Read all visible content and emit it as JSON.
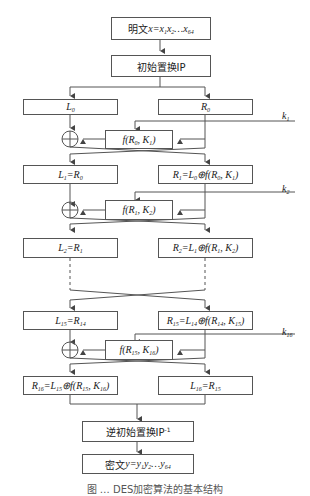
{
  "diagram": {
    "title": "DES加密算法的基本结构",
    "plaintext": {
      "prefix": "明文",
      "formula": "x=x1x2…x64"
    },
    "initial_permutation": {
      "label": "初始置换IP"
    },
    "round0": {
      "left": "L0",
      "right": "R0",
      "f": "f(R0, K1)",
      "key": "k1"
    },
    "round1": {
      "left": "L1=R0",
      "right": "R1=L0⊕f(R0, K1)",
      "f": "f(R1, K2)",
      "key": "k2"
    },
    "round2": {
      "left": "L2=R1",
      "right": "R2=L1⊕f(R1, K2)"
    },
    "round15": {
      "left": "L15=R14",
      "right": "R15=L14⊕f(R14, K15)",
      "f": "f(R15, K16)",
      "key": "k16"
    },
    "round16": {
      "left": "R16=L15⊕f(R15, K16)",
      "right": "L16=R15"
    },
    "inverse_permutation": {
      "label": "逆初始置换IP-1"
    },
    "ciphertext": {
      "prefix": "密文",
      "formula": "y=y1y2…y64"
    },
    "caption": "图 … DES加密算法的基本结构",
    "colors": {
      "line": "#555555",
      "text": "#222222"
    }
  }
}
